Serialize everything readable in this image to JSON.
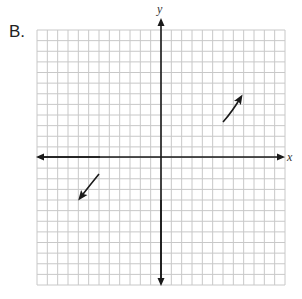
{
  "problem_label": "B.",
  "graph": {
    "x_axis_label": "x",
    "y_axis_label": "y",
    "grid": {
      "cells_x": 24,
      "cells_y": 24,
      "origin_cell": [
        12,
        12
      ]
    },
    "colors": {
      "grid": "#c8c8c8",
      "axis": "#1a1a1a",
      "curve": "#1a1a1a"
    },
    "segments": [
      {
        "name": "end-behavior-quadrant-1",
        "direction": "up-right",
        "from": [
          6.0,
          3.4
        ],
        "to": [
          7.7,
          5.8
        ]
      },
      {
        "name": "end-behavior-quadrant-3",
        "direction": "down-left",
        "from": [
          -6.0,
          -1.6
        ],
        "to": [
          -7.8,
          -4.0
        ]
      }
    ]
  }
}
